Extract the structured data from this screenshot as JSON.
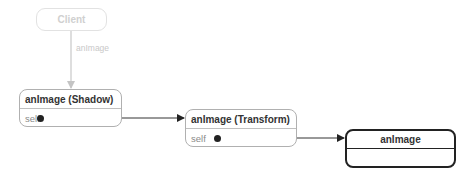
{
  "diagram": {
    "client": {
      "label": "Client"
    },
    "client_link": {
      "label": "anImage"
    },
    "shadow": {
      "title": "anImage (Shadow)",
      "field": "self"
    },
    "transform": {
      "title": "anImage (Transform)",
      "field": "self"
    },
    "target": {
      "title": "anImage"
    }
  },
  "colors": {
    "faded": "#d4d4d4",
    "border": "#a8a8a8",
    "dark": "#222222"
  }
}
